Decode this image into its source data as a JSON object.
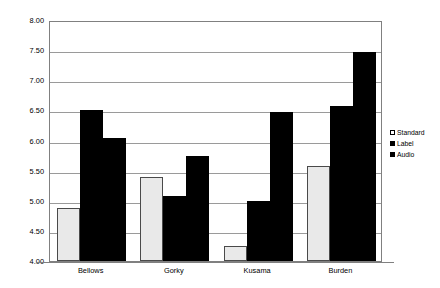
{
  "chart_data": {
    "type": "bar",
    "title": "",
    "subtitle": "",
    "xlabel": "",
    "ylabel": "Mean: I would like to see other works by this artist\"",
    "categories": [
      "Bellows",
      "Gorky",
      "Kusama",
      "Burden"
    ],
    "series": [
      {
        "name": "Standard",
        "color": "#e9e9e9",
        "values": [
          4.88,
          5.4,
          4.25,
          5.57
        ]
      },
      {
        "name": "Label",
        "color": "#000000",
        "values": [
          6.5,
          5.08,
          5.0,
          6.58
        ]
      },
      {
        "name": "Audio",
        "color": "#000000",
        "values": [
          6.05,
          5.75,
          6.48,
          7.47
        ]
      }
    ],
    "ylim": [
      4.0,
      8.0
    ],
    "ytick_step": 0.5,
    "ytick_labels": [
      "8.00",
      "7.50",
      "7.00",
      "6.50",
      "6.00",
      "5.50",
      "5.00",
      "4.50",
      "4.00"
    ],
    "ytick_values": [
      8.0,
      7.5,
      7.0,
      6.5,
      6.0,
      5.5,
      5.0,
      4.5,
      4.0
    ],
    "grid": true,
    "grid_axis": "y",
    "legend_position": "right",
    "legend_entries": [
      "Standard",
      "Label",
      "Audio"
    ],
    "plot_background": "#ffffff",
    "grid_color": "#9a9a9a",
    "axis_color": "#808080"
  }
}
